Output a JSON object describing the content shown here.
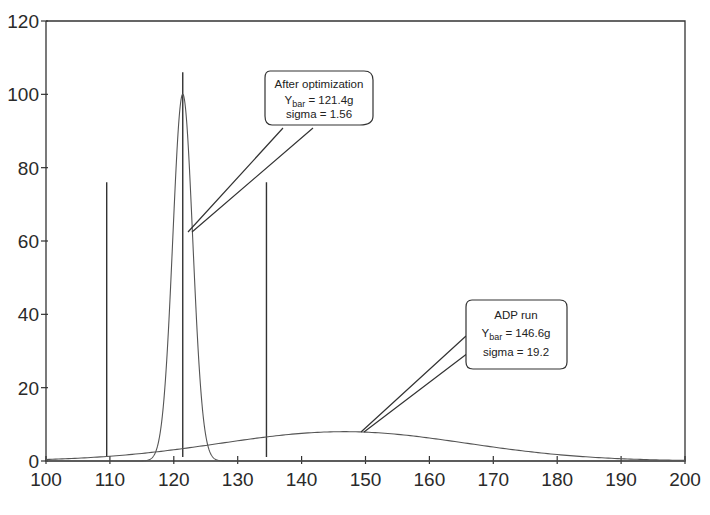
{
  "chart_data": {
    "type": "line",
    "title": "",
    "xlabel": "",
    "ylabel": "",
    "xlim": [
      100,
      200
    ],
    "ylim": [
      0,
      120
    ],
    "grid": false,
    "legend": "none",
    "x_ticks": [
      100,
      110,
      120,
      130,
      140,
      150,
      160,
      170,
      180,
      190,
      200
    ],
    "y_ticks": [
      0,
      20,
      40,
      60,
      80,
      100,
      120
    ],
    "series": [
      {
        "name": "After optimization",
        "kind": "normal-curve",
        "mean": 121.4,
        "sigma": 1.56,
        "peak": 100,
        "color": "#555555"
      },
      {
        "name": "ADP run",
        "kind": "normal-curve",
        "mean": 146.6,
        "sigma": 19.2,
        "peak": 8,
        "color": "#555555"
      }
    ],
    "vertical_lines": [
      {
        "name": "lower-spec-limit",
        "x": 109.5,
        "y_top": 76,
        "color": "#333333"
      },
      {
        "name": "target",
        "x": 121.4,
        "y_top": 106,
        "color": "#333333"
      },
      {
        "name": "upper-spec-limit",
        "x": 134.5,
        "y_top": 76,
        "color": "#333333"
      }
    ],
    "annotations": [
      {
        "name": "after-optimization-callout",
        "lines": [
          "After optimization",
          "Y",
          "bar",
          "= 121.4g",
          "sigma = 1.56"
        ],
        "title": "After optimization",
        "ybar_label": "Y",
        "ybar_sub": "bar",
        "ybar_value": "= 121.4g",
        "sigma": "sigma = 1.56",
        "points_to": {
          "x": 122.2,
          "y": 63
        }
      },
      {
        "name": "adp-run-callout",
        "title": "ADP run",
        "ybar_label": "Y",
        "ybar_sub": "bar",
        "ybar_value": "= 146.6g",
        "sigma": "sigma = 19.2",
        "points_to": {
          "x": 149.5,
          "y": 8
        }
      }
    ]
  },
  "axis": {
    "y_labels": [
      "0",
      "20",
      "40",
      "60",
      "80",
      "100",
      "120"
    ],
    "x_labels": [
      "100",
      "110",
      "120",
      "130",
      "140",
      "150",
      "160",
      "170",
      "180",
      "190",
      "200"
    ]
  },
  "callouts": {
    "after": {
      "title": "After optimization",
      "y": "Y",
      "sub": "bar",
      "val": " = 121.4g",
      "sigma": "sigma = 1.56"
    },
    "adp": {
      "title": "ADP run",
      "y": "Y",
      "sub": "bar",
      "val": " = 146.6g",
      "sigma": "sigma = 19.2"
    }
  }
}
